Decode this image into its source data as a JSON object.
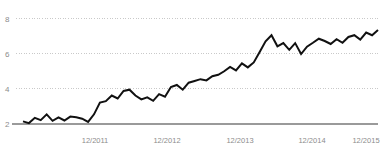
{
  "chart_data": {
    "type": "line",
    "title": "",
    "subtitle": "",
    "xlabel": "",
    "ylabel": "",
    "grid": true,
    "legend": false,
    "xlim": [
      0,
      60
    ],
    "ylim": [
      2,
      8
    ],
    "yticks": [
      8,
      6,
      4,
      2
    ],
    "ytick_labels": [
      "8",
      "6",
      "4",
      "2"
    ],
    "xtick_positions": [
      12,
      24,
      36,
      48,
      60
    ],
    "xtick_labels": [
      "12/2011",
      "12/2012",
      "12/2013",
      "12/2014",
      "12/2015"
    ],
    "series": [
      {
        "name": "value",
        "color": "#111111",
        "x": [
          0,
          1,
          2,
          3,
          4,
          5,
          6,
          7,
          8,
          9,
          10,
          11,
          12,
          13,
          14,
          15,
          16,
          17,
          18,
          19,
          20,
          21,
          22,
          23,
          24,
          25,
          26,
          27,
          28,
          29,
          30,
          31,
          32,
          33,
          34,
          35,
          36,
          37,
          38,
          39,
          40,
          41,
          42,
          43,
          44,
          45,
          46,
          47,
          48,
          49,
          50,
          51,
          52,
          53,
          54,
          55,
          56,
          57,
          58,
          59,
          60
        ],
        "values": [
          2.15,
          2.05,
          2.35,
          2.22,
          2.55,
          2.18,
          2.38,
          2.2,
          2.42,
          2.38,
          2.3,
          2.12,
          2.55,
          3.22,
          3.3,
          3.62,
          3.45,
          3.88,
          3.95,
          3.62,
          3.4,
          3.52,
          3.32,
          3.7,
          3.55,
          4.1,
          4.22,
          3.95,
          4.35,
          4.45,
          4.55,
          4.48,
          4.72,
          4.8,
          5.0,
          5.25,
          5.05,
          5.45,
          5.22,
          5.5,
          6.1,
          6.7,
          7.05,
          6.42,
          6.6,
          6.22,
          6.6,
          5.98,
          6.4,
          6.62,
          6.85,
          6.72,
          6.55,
          6.82,
          6.62,
          6.95,
          7.05,
          6.8,
          7.2,
          7.05,
          7.35
        ]
      }
    ],
    "annotations": []
  },
  "axis": {
    "baseline_label": "2"
  }
}
